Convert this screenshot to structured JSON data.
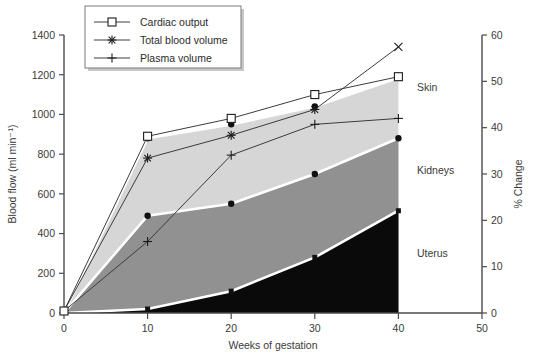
{
  "chart_data": {
    "type": "area",
    "title": "",
    "xlabel": "Weeks of gestation",
    "ylabel": "Blood flow (ml min⁻¹)",
    "y2label": "% Change",
    "xlim": [
      0,
      50
    ],
    "ylim": [
      0,
      1400
    ],
    "y2lim": [
      0,
      60
    ],
    "grid": false,
    "legend_position": "top-left",
    "x_ticks": [
      "0",
      "10",
      "20",
      "30",
      "40",
      "50"
    ],
    "x_tick_values": [
      0,
      10,
      20,
      30,
      40,
      50
    ],
    "y_ticks": [
      "0",
      "200",
      "400",
      "600",
      "800",
      "1000",
      "1200",
      "1400"
    ],
    "y_tick_values": [
      0,
      200,
      400,
      600,
      800,
      1000,
      1200,
      1400
    ],
    "y2_ticks": [
      "0",
      "10",
      "20",
      "30",
      "40",
      "50",
      "60"
    ],
    "y2_tick_values": [
      0,
      10,
      20,
      30,
      40,
      50,
      60
    ],
    "x": [
      0,
      10,
      20,
      30,
      40
    ],
    "stacked_areas": [
      {
        "name": "Uterus",
        "color": "#0a0a0a",
        "cumulative": [
          0,
          20,
          110,
          280,
          515
        ]
      },
      {
        "name": "Kidneys",
        "color": "#919191",
        "cumulative": [
          0,
          490,
          550,
          700,
          880
        ]
      },
      {
        "name": "Skin",
        "color": "#d6d6d6",
        "cumulative": [
          0,
          880,
          950,
          1040,
          1185
        ]
      }
    ],
    "series": [
      {
        "name": "Cardiac output",
        "marker": "square",
        "x": [
          0,
          10,
          20,
          30,
          40
        ],
        "values": [
          10,
          890,
          980,
          1100,
          1190
        ]
      },
      {
        "name": "Total blood volume",
        "marker": "asterisk",
        "x": [
          0,
          10,
          20,
          30,
          40
        ],
        "values": [
          10,
          780,
          895,
          1025,
          1340
        ]
      },
      {
        "name": "Plasma volume",
        "marker": "plus",
        "x": [
          0,
          10,
          20,
          30,
          40
        ],
        "values": [
          10,
          360,
          795,
          950,
          980
        ]
      }
    ],
    "region_labels": [
      {
        "label": "Skin",
        "x": 41.5,
        "y": 1120
      },
      {
        "label": "Kidneys",
        "x": 41.5,
        "y": 700
      },
      {
        "label": "Uterus",
        "x": 41.5,
        "y": 280
      }
    ],
    "legend": [
      {
        "label": "Cardiac output",
        "marker": "square"
      },
      {
        "label": "Total blood volume",
        "marker": "asterisk"
      },
      {
        "label": "Plasma volume",
        "marker": "plus"
      }
    ],
    "colors": {
      "skin": "#d6d6d6",
      "kidneys": "#919191",
      "uterus": "#0a0a0a",
      "axis": "#4a4a4a",
      "line": "#3c3c3c",
      "separator": "#ffffff"
    }
  }
}
